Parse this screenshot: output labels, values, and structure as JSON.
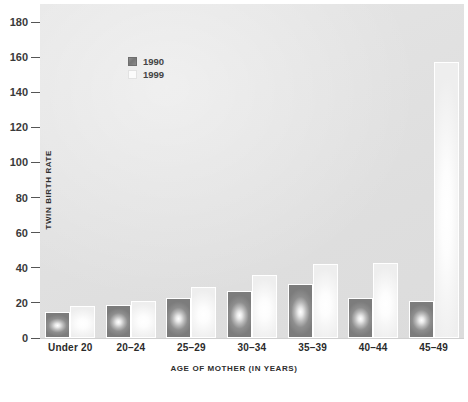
{
  "chart_data": {
    "type": "bar",
    "title": "",
    "xlabel": "AGE OF MOTHER (IN YEARS)",
    "ylabel": "TWIN BIRTH RATE",
    "categories": [
      "Under 20",
      "20–24",
      "25–29",
      "30–34",
      "35–39",
      "40–44",
      "45–49"
    ],
    "series": [
      {
        "name": "1990",
        "color": "#808080",
        "values": [
          15,
          19,
          23,
          27,
          31,
          23,
          21
        ]
      },
      {
        "name": "1999",
        "color": "#ffffff",
        "values": [
          18,
          21,
          29,
          36,
          42,
          43,
          157
        ]
      }
    ],
    "ylim": [
      0,
      180
    ],
    "yticks": [
      0,
      20,
      40,
      60,
      80,
      100,
      120,
      140,
      160,
      180
    ],
    "ytick_labels": [
      "0",
      "20",
      "40",
      "60",
      "80",
      "100",
      "120",
      "140",
      "160",
      "180"
    ],
    "grid": false,
    "legend_position": "upper-left-inside",
    "plot_background": "#e2e2e2"
  },
  "legend": {
    "entries": [
      {
        "label": "1990",
        "swatch": "legend-swatch-1990"
      },
      {
        "label": "1999",
        "swatch": "legend-swatch-1999"
      }
    ]
  }
}
